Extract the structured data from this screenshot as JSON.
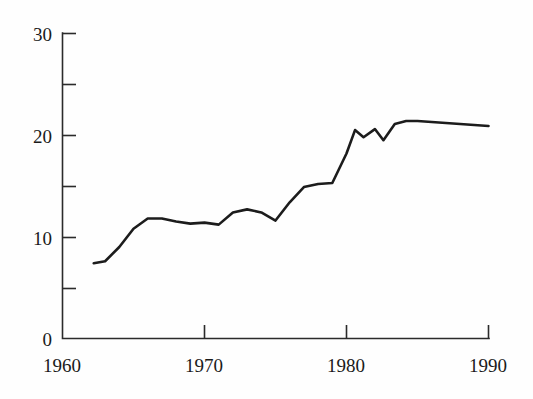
{
  "chart_data": {
    "type": "line",
    "title": "",
    "subtitle": "",
    "xlabel": "",
    "ylabel": "",
    "xlim": [
      1960,
      1990
    ],
    "ylim": [
      0,
      30
    ],
    "grid": false,
    "legend": null,
    "x_ticks_major": [
      1960,
      1970,
      1980,
      1990
    ],
    "x_tick_labels": [
      "1960",
      "1970",
      "1980",
      "1990"
    ],
    "y_ticks_major": [
      0,
      10,
      20,
      30
    ],
    "y_tick_labels": [
      "0",
      "10",
      "20",
      "30"
    ],
    "y_ticks_minor": [
      5,
      15,
      25
    ],
    "tick_direction": "in",
    "axis_spines": [
      "left",
      "bottom"
    ],
    "line_color": "#1c1c1c",
    "background_color": "#fefefe",
    "x": [
      1962.2,
      1963.0,
      1964.0,
      1965.0,
      1966.0,
      1967.0,
      1968.0,
      1969.0,
      1970.0,
      1971.0,
      1972.0,
      1973.0,
      1974.0,
      1975.0,
      1976.0,
      1977.0,
      1978.0,
      1979.0,
      1980.0,
      1980.6,
      1981.2,
      1982.0,
      1982.6,
      1983.4,
      1984.2,
      1985.0,
      1986.0,
      1987.0,
      1988.0,
      1989.0,
      1990.0
    ],
    "y": [
      7.4,
      7.6,
      9.0,
      10.8,
      11.8,
      11.8,
      11.5,
      11.3,
      11.4,
      11.2,
      12.4,
      12.7,
      12.4,
      11.6,
      13.4,
      14.9,
      15.2,
      15.3,
      18.2,
      20.5,
      19.8,
      20.6,
      19.5,
      21.1,
      21.4,
      21.4,
      21.3,
      21.2,
      21.1,
      21.0,
      20.9
    ],
    "series": [
      {
        "name": "series-1",
        "values": [
          7.4,
          7.6,
          9.0,
          10.8,
          11.8,
          11.8,
          11.5,
          11.3,
          11.4,
          11.2,
          12.4,
          12.7,
          12.4,
          11.6,
          13.4,
          14.9,
          15.2,
          15.3,
          18.2,
          20.5,
          19.8,
          20.6,
          19.5,
          21.1,
          21.4,
          21.4,
          21.3,
          21.2,
          21.1,
          21.0,
          20.9
        ]
      }
    ]
  },
  "axes": {
    "y_labels": [
      {
        "text": "30",
        "value": 30
      },
      {
        "text": "20",
        "value": 20
      },
      {
        "text": "10",
        "value": 10
      },
      {
        "text": "0",
        "value": 0
      }
    ],
    "x_labels": [
      {
        "text": "1960",
        "value": 1960
      },
      {
        "text": "1970",
        "value": 1970
      },
      {
        "text": "1980",
        "value": 1980
      },
      {
        "text": "1990",
        "value": 1990
      }
    ]
  }
}
